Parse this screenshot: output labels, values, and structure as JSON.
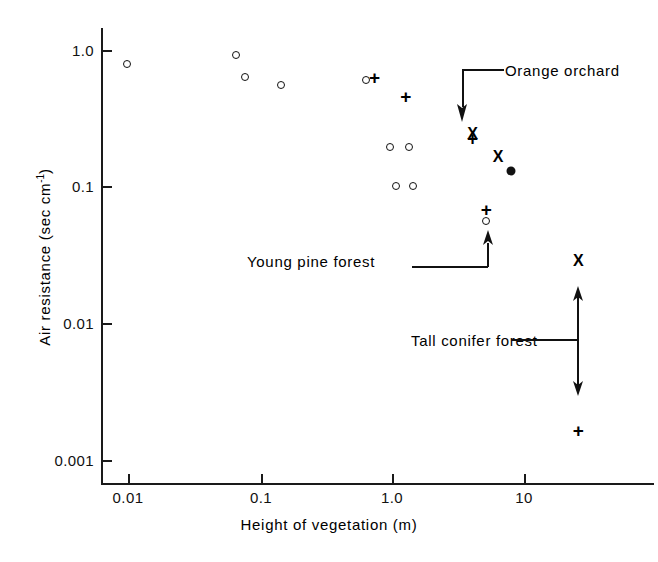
{
  "figure": {
    "background": "#ffffff",
    "ink": "#111111"
  },
  "chart_data": {
    "type": "scatter",
    "title": "",
    "xlabel": "Height of vegetation (m)",
    "ylabel": "Air resistance (sec cm⁻¹)",
    "xscale": "log",
    "yscale": "log",
    "xlim": [
      0.008,
      60
    ],
    "ylim": [
      0.001,
      1.6
    ],
    "grid": false,
    "legend": "none",
    "xticks": [
      {
        "value": 0.01,
        "label": "0.01"
      },
      {
        "value": 0.1,
        "label": "0.1"
      },
      {
        "value": 1.0,
        "label": "1.0"
      },
      {
        "value": 10,
        "label": "10"
      }
    ],
    "yticks": [
      {
        "value": 1.0,
        "label": "1.0"
      },
      {
        "value": 0.1,
        "label": "0.1"
      },
      {
        "value": 0.01,
        "label": "0.01"
      },
      {
        "value": 0.001,
        "label": "0.001"
      }
    ],
    "series": [
      {
        "name": "open-circle",
        "marker": "open-circle",
        "points": [
          {
            "x": 0.0098,
            "y": 0.79
          },
          {
            "x": 0.066,
            "y": 0.92
          },
          {
            "x": 0.077,
            "y": 0.64
          },
          {
            "x": 0.145,
            "y": 0.555
          },
          {
            "x": 0.64,
            "y": 0.605
          },
          {
            "x": 0.96,
            "y": 0.195
          },
          {
            "x": 1.36,
            "y": 0.195
          },
          {
            "x": 1.08,
            "y": 0.101
          },
          {
            "x": 1.44,
            "y": 0.101
          },
          {
            "x": 5.2,
            "y": 0.056
          }
        ]
      },
      {
        "name": "plus",
        "marker": "plus",
        "points": [
          {
            "x": 0.74,
            "y": 0.63
          },
          {
            "x": 1.28,
            "y": 0.455
          },
          {
            "x": 4.1,
            "y": 0.225
          },
          {
            "x": 5.2,
            "y": 0.068
          },
          {
            "x": 26.0,
            "y": 0.00165
          }
        ]
      },
      {
        "name": "cross",
        "marker": "cross",
        "points": [
          {
            "x": 4.1,
            "y": 0.245
          },
          {
            "x": 6.4,
            "y": 0.165
          },
          {
            "x": 26.0,
            "y": 0.0285
          }
        ]
      },
      {
        "name": "filled-circle",
        "marker": "filled-circle",
        "points": [
          {
            "x": 8.0,
            "y": 0.13
          }
        ]
      }
    ],
    "annotations": [
      {
        "id": "orange-orchard",
        "text": "Orange orchard"
      },
      {
        "id": "young-pine-forest",
        "text": "Young pine forest"
      },
      {
        "id": "tall-conifer-forest",
        "text": "Tall conifer forest"
      }
    ]
  }
}
